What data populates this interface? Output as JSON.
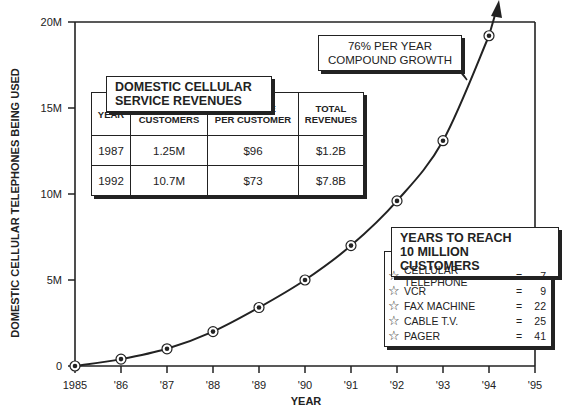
{
  "chart_data": {
    "type": "line",
    "title": "",
    "xlabel": "YEAR",
    "ylabel": "DOMESTIC CELLULAR TELEPHONES BEING USED",
    "x": [
      "1985",
      "'86",
      "'87",
      "'88",
      "'89",
      "'90",
      "'91",
      "'92",
      "'93",
      "'94"
    ],
    "series": [
      {
        "name": "Domestic cellular telephones",
        "values": [
          0,
          0.4,
          1.0,
          2.0,
          3.4,
          5.0,
          7.0,
          9.6,
          13.1,
          19.2
        ],
        "unit": "M"
      }
    ],
    "x_ticks": [
      "1985",
      "'86",
      "'87",
      "'88",
      "'89",
      "'90",
      "'91",
      "'92",
      "'93",
      "'94",
      "'95"
    ],
    "y_ticks": [
      "0",
      "5M",
      "10M",
      "15M",
      "20M"
    ],
    "ylim": [
      0,
      20
    ],
    "grid": false,
    "annotations": [
      "76% PER YEAR COMPOUND GROWTH"
    ]
  },
  "axes": {
    "ylabel": "DOMESTIC CELLULAR TELEPHONES BEING USED",
    "xlabel": "YEAR",
    "x_ticks": [
      "1985",
      "'86",
      "'87",
      "'88",
      "'89",
      "'90",
      "'91",
      "'92",
      "'93",
      "'94",
      "'95"
    ],
    "y_ticks": [
      "0",
      "5M",
      "10M",
      "15M",
      "20M"
    ]
  },
  "growth_callout": "76% PER YEAR\nCOMPOUND GROWTH",
  "revenue_table": {
    "title": "DOMESTIC CELLULAR\nSERVICE REVENUES",
    "headers": [
      "YEAR",
      "NO. OF\nCUSTOMERS",
      "REVENUE\nPER CUSTOMER",
      "TOTAL\nREVENUES"
    ],
    "rows": [
      [
        "1987",
        "1.25M",
        "$96",
        "$1.2B"
      ],
      [
        "1992",
        "10.7M",
        "$73",
        "$7.8B"
      ]
    ]
  },
  "years_to_reach": {
    "title": "YEARS TO REACH\n10 MILLION CUSTOMERS",
    "items": [
      {
        "icon": "☆",
        "name": "CELLULAR TELEPHONE",
        "eq": "=",
        "value": "7"
      },
      {
        "icon": "☆",
        "name": "VCR",
        "eq": "=",
        "value": "9"
      },
      {
        "icon": "☆",
        "name": "FAX MACHINE",
        "eq": "=",
        "value": "22"
      },
      {
        "icon": "☆",
        "name": "CABLE T.V.",
        "eq": "=",
        "value": "25"
      },
      {
        "icon": "☆",
        "name": "PAGER",
        "eq": "=",
        "value": "41"
      }
    ]
  }
}
